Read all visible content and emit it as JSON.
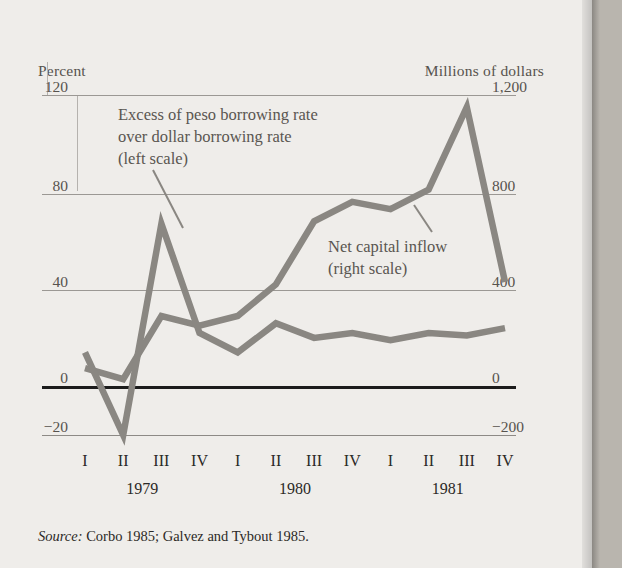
{
  "figure": {
    "source_label": "Source:",
    "source_text": "Corbo 1985; Galvez and Tybout 1985."
  },
  "axes": {
    "left_title": "Percent",
    "right_title": "Millions of dollars",
    "left_ticks": [
      "120",
      "80",
      "40",
      "0",
      "−20"
    ],
    "right_ticks": [
      "1,200",
      "800",
      "400",
      "0",
      "−200"
    ],
    "quarters": [
      "I",
      "II",
      "III",
      "IV",
      "I",
      "II",
      "III",
      "IV",
      "I",
      "II",
      "III",
      "IV"
    ],
    "years": [
      "1979",
      "1980",
      "1981"
    ]
  },
  "annotations": {
    "peso_line1": "Excess of peso borrowing rate",
    "peso_line2": "over dollar borrowing rate",
    "peso_line3": "(left scale)",
    "inflow_line1": "Net capital inflow",
    "inflow_line2": "(right scale)"
  },
  "colors": {
    "series": "#8a8782",
    "zero_axis": "#1c1c1c",
    "grid": "#9b9894",
    "text": "#2b2926",
    "muted_text": "#57534e",
    "paper": "#efedea",
    "page_edge": "#b9b5ae"
  },
  "chart_data": {
    "type": "line",
    "title": "",
    "xlabel": "",
    "grid": true,
    "legend": "annotations",
    "x": [
      "1979-I",
      "1979-II",
      "1979-III",
      "1979-IV",
      "1980-I",
      "1980-II",
      "1980-III",
      "1980-IV",
      "1981-I",
      "1981-II",
      "1981-III",
      "1981-IV"
    ],
    "categories": [
      "I",
      "II",
      "III",
      "IV",
      "I",
      "II",
      "III",
      "IV",
      "I",
      "II",
      "III",
      "IV"
    ],
    "axes": {
      "left": {
        "label": "Percent",
        "ticks": [
          120,
          80,
          40,
          0,
          -20
        ],
        "ylim": [
          -20,
          120
        ]
      },
      "right": {
        "label": "Millions of dollars",
        "ticks": [
          1200,
          800,
          400,
          0,
          -200
        ],
        "ylim": [
          -200,
          1200
        ]
      }
    },
    "series": [
      {
        "name": "Excess of peso borrowing rate over dollar borrowing rate (left scale)",
        "axis": "left",
        "unit": "percent",
        "values": [
          14,
          -20,
          67,
          22,
          14,
          26,
          20,
          22,
          19,
          22,
          21,
          24
        ]
      },
      {
        "name": "Net capital inflow (right scale)",
        "axis": "right",
        "unit": "millions of dollars",
        "values": [
          75,
          30,
          290,
          250,
          290,
          420,
          680,
          760,
          730,
          810,
          1150,
          430
        ]
      }
    ]
  }
}
